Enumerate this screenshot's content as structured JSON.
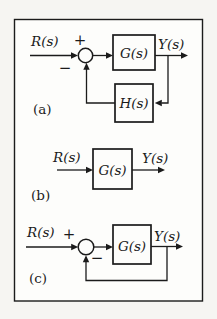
{
  "figure": {
    "panels": [
      {
        "label": "(a)",
        "input_signal": "R(s)",
        "output_signal": "Y(s)",
        "plus_sign": "+",
        "minus_sign": "−",
        "forward_block": "G(s)",
        "feedback_block": "H(s)"
      },
      {
        "label": "(b)",
        "input_signal": "R(s)",
        "output_signal": "Y(s)",
        "forward_block": "G(s)"
      },
      {
        "label": "(c)",
        "input_signal": "R(s)",
        "output_signal": "Y(s)",
        "plus_sign": "+",
        "minus_sign": "−",
        "forward_block": "G(s)"
      }
    ],
    "colors": {
      "line": "#1b1b1b",
      "paper": "#f6f5f2",
      "box_fill": "#fdfdfb"
    }
  }
}
